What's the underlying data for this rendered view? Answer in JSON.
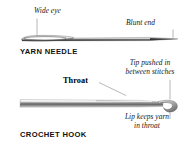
{
  "figure": {
    "background_color": "#ffffff",
    "ink_color": "#1a1a1a",
    "leader_line_color": "#8a8a8a"
  },
  "diagrams": [
    {
      "id": "yarn-needle",
      "part_name": "YARN NEEDLE",
      "callouts": [
        {
          "id": "wide-eye",
          "text": "Wide eye",
          "style": "italic"
        },
        {
          "id": "blunt-end",
          "text": "Blunt end",
          "style": "italic"
        }
      ]
    },
    {
      "id": "crochet-hook",
      "part_name": "CROCHET HOOK",
      "callouts": [
        {
          "id": "throat",
          "text": "Throat",
          "style": "bold-serif"
        },
        {
          "id": "tip-pushed",
          "line1": "Tip pushed in",
          "line2": "between stitches",
          "style": "italic"
        },
        {
          "id": "lip-keeps",
          "line1": "Lip keeps yarn",
          "line2": "in throat",
          "style": "italic"
        }
      ]
    }
  ]
}
